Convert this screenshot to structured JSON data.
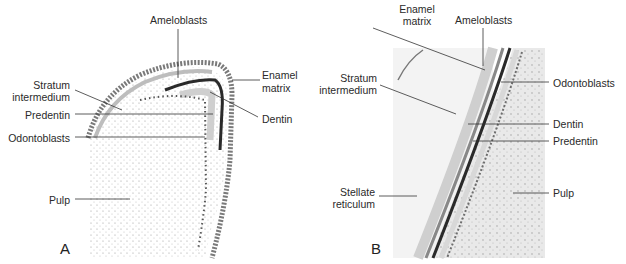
{
  "figure": {
    "panels": [
      {
        "letter": "A",
        "labels": {
          "ameloblasts": "Ameloblasts",
          "enamel_matrix_1": "Enamel",
          "enamel_matrix_2": "matrix",
          "stratum_1": "Stratum",
          "stratum_2": "intermedium",
          "dentin": "Dentin",
          "predentin": "Predentin",
          "odontoblasts": "Odontoblasts",
          "pulp": "Pulp"
        }
      },
      {
        "letter": "B",
        "labels": {
          "enamel_matrix_1": "Enamel",
          "enamel_matrix_2": "matrix",
          "ameloblasts": "Ameloblasts",
          "stratum_1": "Stratum",
          "stratum_2": "intermedium",
          "odontoblasts": "Odontoblasts",
          "dentin": "Dentin",
          "predentin": "Predentin",
          "stellate_1": "Stellate",
          "stellate_2": "reticulum",
          "pulp": "Pulp"
        }
      }
    ]
  }
}
